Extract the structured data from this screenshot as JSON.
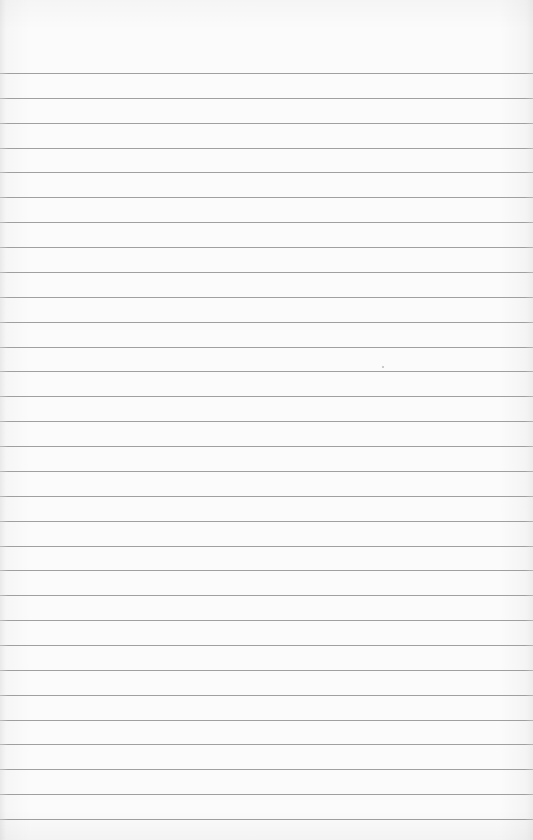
{
  "page": {
    "type": "lined-paper",
    "background_color": "#fbfbfb",
    "rule_color": "#969696",
    "rules": {
      "count": 31,
      "first_y": 73,
      "spacing": 24.87
    },
    "specks": [
      {
        "x": 382,
        "y": 366
      }
    ]
  }
}
